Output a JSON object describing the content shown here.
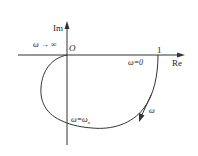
{
  "diagram": {
    "type": "nyquist-plot",
    "axes": {
      "real_label": "Re",
      "imag_label": "Im",
      "origin_label": "O",
      "real_tick_label": "1"
    },
    "annotations": {
      "omega_infinity": "ω → ∞",
      "omega_zero": "ω=0",
      "omega_x": "ω=ω",
      "omega_x_subscript": "x",
      "direction": "ω"
    },
    "colors": {
      "line": "#333333",
      "background": "#ffffff"
    }
  }
}
